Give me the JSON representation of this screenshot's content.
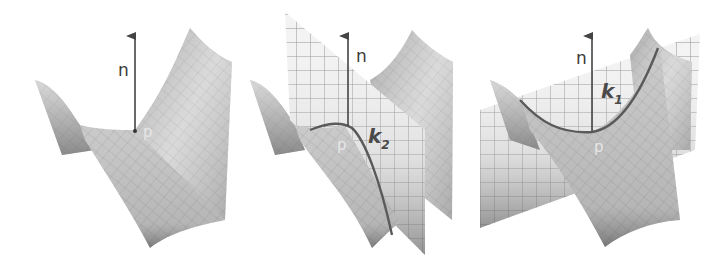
{
  "figure": {
    "panels": [
      {
        "id": "surface",
        "normal_label": "n",
        "point_label": "p"
      },
      {
        "id": "section-k2",
        "normal_label": "n",
        "point_label": "p",
        "curve_label": "k",
        "curve_subscript": "2"
      },
      {
        "id": "section-k1",
        "normal_label": "n",
        "point_label": "p",
        "curve_label": "k",
        "curve_subscript": "1"
      }
    ]
  },
  "colors": {
    "surface_light": "#d9d9d9",
    "surface_mid": "#b5b5b5",
    "surface_dark": "#7d7d7d",
    "plane_fill": "#f2f2f2",
    "plane_grid": "#8a8a8a",
    "curve": "#5a5a5a",
    "arrow": "#444444"
  }
}
